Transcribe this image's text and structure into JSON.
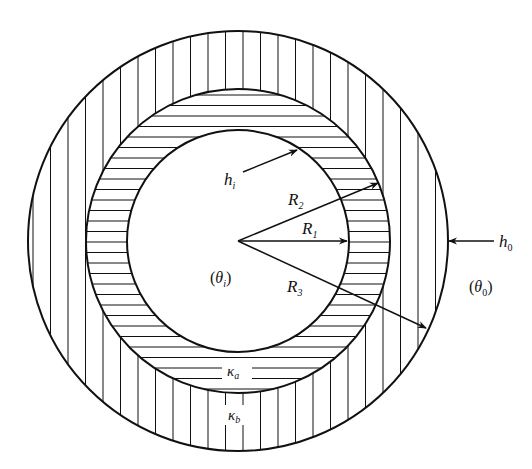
{
  "diagram": {
    "type": "concentric-cylinder-cross-section",
    "colors": {
      "stroke": "#111111",
      "background": "#ffffff"
    },
    "geometry": {
      "center": [
        238,
        241
      ],
      "radii": {
        "R1": 111,
        "R2": 152,
        "R3": 210
      }
    },
    "labels": {
      "h_i": {
        "base": "h",
        "sub": "i"
      },
      "h_o": {
        "base": "h",
        "sub": "0"
      },
      "R1": {
        "base": "R",
        "sub": "1"
      },
      "R2": {
        "base": "R",
        "sub": "2"
      },
      "R3": {
        "base": "R",
        "sub": "3"
      },
      "theta_i": {
        "open": "(",
        "base": "θ",
        "sub": "i",
        "close": ")"
      },
      "theta_o": {
        "open": "(",
        "base": "θ",
        "sub": "0",
        "close": ")"
      },
      "kappa_a": {
        "base": "κ",
        "sub": "a"
      },
      "kappa_b": {
        "base": "κ",
        "sub": "b"
      }
    },
    "regions": [
      {
        "name": "inner-fluid",
        "label": "θi"
      },
      {
        "name": "layer-a",
        "hatch": "horizontal",
        "label": "κa"
      },
      {
        "name": "layer-b",
        "hatch": "vertical",
        "label": "κb"
      },
      {
        "name": "outer-fluid",
        "label": "θ0"
      }
    ]
  }
}
